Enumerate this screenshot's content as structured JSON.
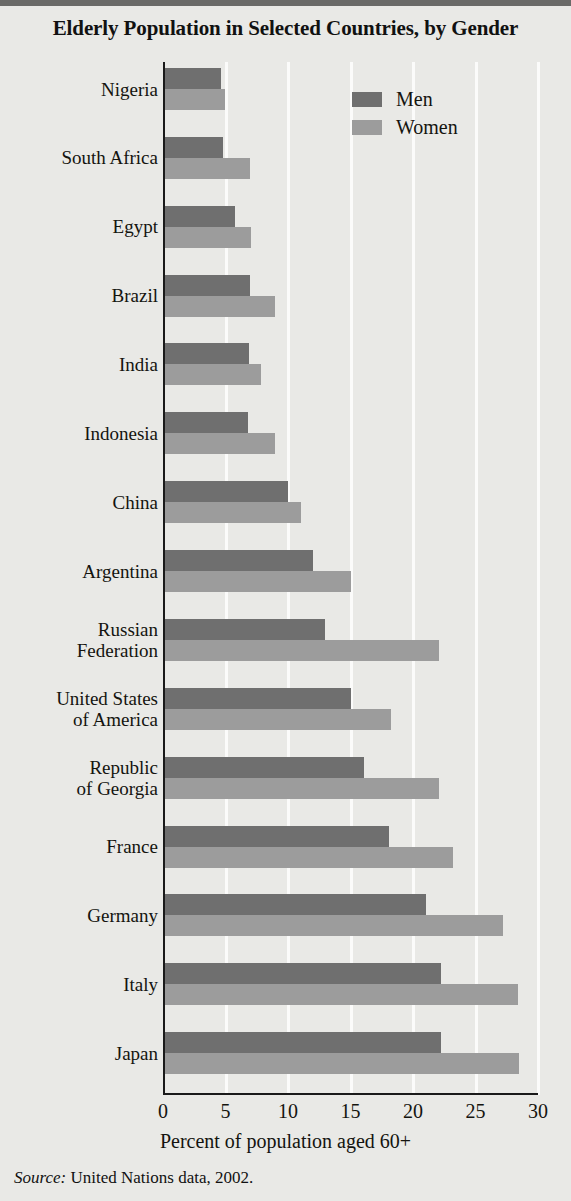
{
  "title": "Elderly Population in Selected Countries, by Gender",
  "source_prefix": "Source:",
  "source_text": " United Nations data, 2002.",
  "legend": {
    "position": "top-right",
    "entries": [
      {
        "label": "Men",
        "color": "#6f6f6f",
        "icon": "legend-swatch-icon"
      },
      {
        "label": "Women",
        "color": "#9c9c9c",
        "icon": "legend-swatch-icon"
      }
    ]
  },
  "colors": {
    "men": "#6f6f6f",
    "women": "#9c9c9c",
    "background": "#e9e9e6",
    "gridline": "#fbfbfa",
    "axis": "#1a1a1a",
    "text": "#14140f"
  },
  "chart_data": {
    "type": "bar",
    "orientation": "horizontal",
    "title": "Elderly Population in Selected Countries, by Gender",
    "xlabel": "Percent of population aged 60+",
    "ylabel": "",
    "xlim": [
      0,
      30
    ],
    "xticks": [
      0,
      5,
      10,
      15,
      20,
      25,
      30
    ],
    "xtick_labels": [
      "0",
      "5",
      "10",
      "15",
      "20",
      "25",
      "30"
    ],
    "grid": "vertical",
    "legend_position": "top right",
    "categories": [
      "Nigeria",
      "South Africa",
      "Egypt",
      "Brazil",
      "India",
      "Indonesia",
      "China",
      "Argentina",
      "Russian Federation",
      "United States of America",
      "Republic of Georgia",
      "France",
      "Germany",
      "Italy",
      "Japan"
    ],
    "series": [
      {
        "name": "Men",
        "color": "#6f6f6f",
        "values": [
          4.5,
          4.6,
          5.6,
          6.8,
          6.7,
          6.6,
          9.8,
          11.8,
          12.8,
          14.9,
          15.9,
          17.9,
          20.9,
          22.1,
          22.1
        ]
      },
      {
        "name": "Women",
        "color": "#9c9c9c",
        "values": [
          4.8,
          6.8,
          6.9,
          8.8,
          7.7,
          8.8,
          10.9,
          14.9,
          21.9,
          18.1,
          21.9,
          23.0,
          27.0,
          28.2,
          28.3
        ]
      }
    ]
  }
}
